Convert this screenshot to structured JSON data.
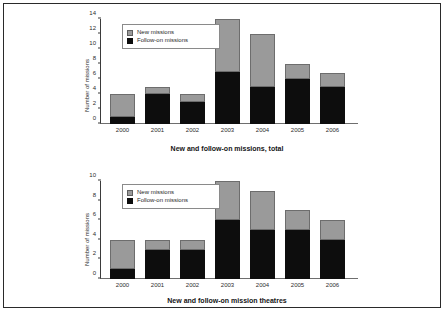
{
  "figure": {
    "border_color": "#2a2a2a",
    "background": "#ffffff"
  },
  "legend": {
    "new_label": "New missions",
    "followon_label": "Follow-on missions",
    "new_color": "#9a9a9a",
    "followon_color": "#0d0d0d"
  },
  "chart_data": [
    {
      "type": "bar",
      "id": "missions-total",
      "stacked": true,
      "title": "New and follow-on missions, total",
      "xlabel": "",
      "ylabel": "Number of missions",
      "categories": [
        "2000",
        "2001",
        "2002",
        "2003",
        "2004",
        "2005",
        "2006"
      ],
      "series": [
        {
          "name": "Follow-on missions",
          "color": "#0d0d0d",
          "values": [
            1,
            4,
            3,
            7,
            5,
            6,
            5
          ]
        },
        {
          "name": "New missions",
          "color": "#9a9a9a",
          "values": [
            3,
            1,
            1,
            7,
            7,
            2,
            1.8
          ]
        }
      ],
      "totals": [
        4,
        5,
        4,
        14,
        12,
        8,
        6.8
      ],
      "ylim": [
        0,
        14
      ],
      "yticks": [
        0,
        2,
        4,
        6,
        8,
        10,
        12,
        14
      ],
      "grid": false,
      "legend_position": "upper left"
    },
    {
      "type": "bar",
      "id": "mission-theatres",
      "stacked": true,
      "title": "New and follow-on mission theatres",
      "xlabel": "",
      "ylabel": "Number of missions",
      "categories": [
        "2000",
        "2001",
        "2002",
        "2003",
        "2004",
        "2005",
        "2006"
      ],
      "series": [
        {
          "name": "Follow-on missions",
          "color": "#0d0d0d",
          "values": [
            1,
            3,
            3,
            6,
            5,
            5,
            4
          ]
        },
        {
          "name": "New missions",
          "color": "#9a9a9a",
          "values": [
            3,
            1,
            1,
            4,
            4,
            2,
            2
          ]
        }
      ],
      "totals": [
        4,
        4,
        4,
        10,
        9,
        7,
        6
      ],
      "ylim": [
        0,
        10
      ],
      "yticks": [
        0,
        2,
        4,
        6,
        8,
        10
      ],
      "grid": false,
      "legend_position": "upper left"
    }
  ]
}
